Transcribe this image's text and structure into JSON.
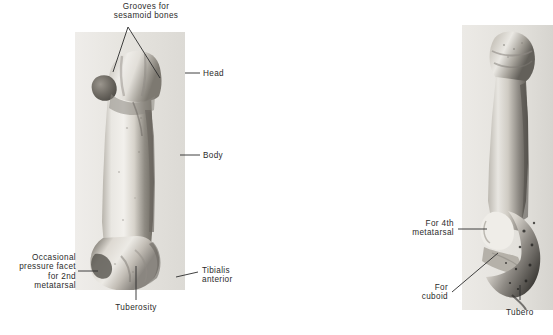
{
  "figure": {
    "background_color": "#ffffff",
    "label_color": "#2b2b2b",
    "width": 553,
    "height": 335
  },
  "panels": [
    {
      "name": "left-bone-photo",
      "description": "fifth metatarsal dorsal view",
      "x": 75,
      "y": 32,
      "width": 110,
      "height": 258,
      "tone_light": "#e8e6e1",
      "tone_mid": "#b3afa8",
      "tone_dark": "#6e6a63"
    },
    {
      "name": "right-bone-photo",
      "description": "fifth metatarsal proximal lateral view",
      "x": 462,
      "y": 25,
      "width": 91,
      "height": 285,
      "tone_light": "#e4e2dd",
      "tone_mid": "#a9a59e",
      "tone_dark": "#4a4742"
    }
  ],
  "labels": {
    "grooves_sesamoid": "Grooves for\nsesamoid bones",
    "head": "Head",
    "body": "Body",
    "occasional_pressure_facet": "Occasional\npressure facet\nfor 2nd\nmetatarsal",
    "tibialis_anterior": "Tibialis\nanterior",
    "tuberosity": "Tuberosity",
    "for_4th_metatarsal": "For 4th\nmetatarsal",
    "for_cuboid": "For\ncuboid",
    "tuberosity_right": "Tubero"
  }
}
